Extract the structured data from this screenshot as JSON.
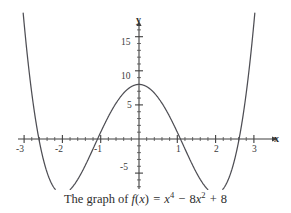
{
  "chart_data": {
    "type": "line",
    "title": "",
    "caption": "The graph of f(x) = x⁴ − 8x² + 8",
    "function": "f(x) = x^4 - 8x^2 + 8",
    "xlabel": "x",
    "ylabel": "y",
    "xlim": [
      -3.15,
      3.15
    ],
    "ylim": [
      -9.5,
      18.5
    ],
    "grid": false,
    "legend": null,
    "x_ticks_major": [
      -3,
      -2,
      -1,
      1,
      2,
      3
    ],
    "x_tick_labels": [
      "-3",
      "-2",
      "-1",
      "1",
      "2",
      "3"
    ],
    "x_ticks_minor_step": 0.2,
    "y_ticks_major": [
      -5,
      5,
      10,
      15
    ],
    "y_tick_labels": [
      "-5",
      "5",
      "10",
      "15"
    ],
    "y_ticks_minor_step": 1,
    "series": [
      {
        "name": "f(x) = x^4 - 8x^2 + 8",
        "color": "#4e4e54",
        "x": [
          -3.1,
          -3.0,
          -2.9,
          -2.8,
          -2.7,
          -2.6,
          -2.5,
          -2.4,
          -2.3,
          -2.2,
          -2.1,
          -2.0,
          -1.9,
          -1.8,
          -1.7,
          -1.6,
          -1.5,
          -1.4,
          -1.3,
          -1.2,
          -1.1,
          -1.0,
          -0.9,
          -0.8,
          -0.7,
          -0.6,
          -0.5,
          -0.4,
          -0.3,
          -0.2,
          -0.1,
          0.0,
          0.1,
          0.2,
          0.3,
          0.4,
          0.5,
          0.6,
          0.7,
          0.8,
          0.9,
          1.0,
          1.1,
          1.2,
          1.3,
          1.4,
          1.5,
          1.6,
          1.7,
          1.8,
          1.9,
          2.0,
          2.1,
          2.2,
          2.3,
          2.4,
          2.5,
          2.6,
          2.7,
          2.8,
          2.9,
          3.0,
          3.1
        ],
        "y": [
          15.4,
          9.0,
          3.4,
          -1.3,
          -5.2,
          -8.4,
          -10.9,
          -12.8,
          -14.3,
          -15.3,
          -15.8,
          -16.0,
          -15.8,
          -15.4,
          -14.8,
          -14.0,
          -13.0,
          -11.8,
          -10.7,
          -9.4,
          -8.2,
          -7.0,
          -5.8,
          -4.7,
          -3.6,
          -2.7,
          -1.9,
          -1.2,
          -0.7,
          -0.3,
          -0.1,
          8.0,
          -0.1,
          -0.3,
          -0.7,
          -1.2,
          -1.9,
          -2.7,
          -3.6,
          -4.7,
          -5.8,
          -7.0,
          -8.2,
          -9.4,
          -10.7,
          -11.8,
          -13.0,
          -14.0,
          -14.8,
          -15.4,
          -15.8,
          -16.0,
          -15.8,
          -15.3,
          -14.3,
          -12.8,
          -10.9,
          -8.4,
          -5.2,
          -1.3,
          3.4,
          9.0,
          15.4
        ],
        "roots_approx": [
          -2.615,
          -1.082,
          1.082,
          2.615
        ],
        "local_max": {
          "x": 0,
          "y": 8
        },
        "local_minima": [
          {
            "x": -2,
            "y": -8
          },
          {
            "x": 2,
            "y": -8
          }
        ]
      }
    ]
  },
  "axes": {
    "x_axis_label": "x",
    "y_axis_label": "y"
  },
  "tick_labels": {
    "y": [
      {
        "value": 15,
        "text": "15"
      },
      {
        "value": 10,
        "text": "10"
      },
      {
        "value": 5,
        "text": "5"
      },
      {
        "value": -5,
        "text": "-5"
      }
    ],
    "x": [
      {
        "value": -3,
        "text": "-3"
      },
      {
        "value": -2,
        "text": "-2"
      },
      {
        "value": -1,
        "text": "-1"
      },
      {
        "value": 1,
        "text": "1"
      },
      {
        "value": 2,
        "text": "2"
      },
      {
        "value": 3,
        "text": "3"
      }
    ]
  },
  "caption": {
    "lead": "The graph of",
    "fn_name": "f",
    "fn_open": "(",
    "fn_var": "x",
    "fn_close": ")",
    "equals": "=",
    "term1_base": "x",
    "term1_exp": "4",
    "minus": "−",
    "term2_coef": "8",
    "term2_base": "x",
    "term2_exp": "2",
    "plus": "+",
    "term3": "8"
  },
  "colors": {
    "curve": "#4e4e54",
    "axis": "#3f3f3f",
    "text": "#2e2e2e",
    "background": "#ffffff"
  }
}
